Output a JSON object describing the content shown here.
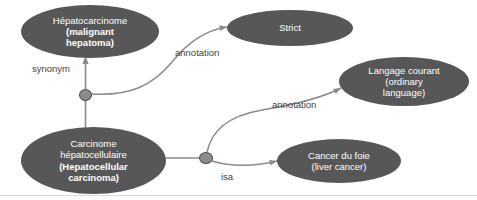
{
  "diagram": {
    "background_color": "#ffffff",
    "node_fill_color": "#575757",
    "node_text_color": "#ffffff",
    "edge_color": "#808080",
    "junction_fill_color": "#8c8c8c",
    "junction_border_color": "#4a4a4a",
    "label_text_color": "#3f3f3f"
  },
  "nodes": {
    "hepatocarcinome": {
      "lines": [
        {
          "text": "Hépatocarcinome",
          "bold": false
        },
        {
          "text": "(malignant",
          "bold": true
        },
        {
          "text": "hepatoma)",
          "bold": true
        }
      ]
    },
    "strict": {
      "lines": [
        {
          "text": "Strict",
          "bold": false
        }
      ]
    },
    "langage_courant": {
      "lines": [
        {
          "text": "Langage courant",
          "bold": false
        },
        {
          "text": "(ordinary",
          "bold": false
        },
        {
          "text": "language)",
          "bold": false
        }
      ]
    },
    "carcinome_hepatocellulaire": {
      "lines": [
        {
          "text": "Carcinome",
          "bold": false
        },
        {
          "text": "hépatocellulaire",
          "bold": false
        },
        {
          "text": "(Hepatocellular",
          "bold": true
        },
        {
          "text": "carcinoma)",
          "bold": true
        }
      ]
    },
    "cancer_du_foie": {
      "lines": [
        {
          "text": "Cancer du foie",
          "bold": false
        },
        {
          "text": "(liver cancer)",
          "bold": false
        }
      ]
    }
  },
  "edge_labels": {
    "synonym": "synonym",
    "annotation_1": "annotation",
    "annotation_2": "annotation",
    "isa": "isa"
  },
  "junctions": {
    "left": "relation-node-synonym",
    "right": "relation-node-isa"
  }
}
